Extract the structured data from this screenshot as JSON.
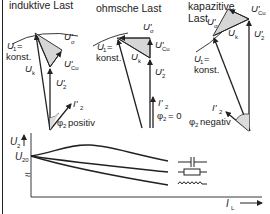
{
  "diagram": {
    "panels": [
      {
        "id": "inductive",
        "title": "induktive Last",
        "labels": {
          "u1": "U",
          "u1_sub": "1",
          "u1_eq": "=",
          "konst": "konst.",
          "usigma": "U'",
          "usigma_sub": "σ",
          "ucu": "U'",
          "ucu_sub": "Cu",
          "uk": "U",
          "uk_sub": "k",
          "u2": "U'",
          "u2_sub": "2",
          "i2": "I'",
          "i2_sub": "2",
          "phi": "φ",
          "phi_sub": "2",
          "phi_text": "positiv"
        }
      },
      {
        "id": "ohmic",
        "title": "ohmsche Last",
        "labels": {
          "u1": "U",
          "u1_sub": "1",
          "u1_eq": "=",
          "konst": "konst.",
          "usigma": "U'",
          "usigma_sub": "σ",
          "ucu": "U'",
          "ucu_sub": "Cu",
          "uk": "U",
          "uk_sub": "k",
          "u2": "U'",
          "u2_sub": "2",
          "i2": "I'",
          "i2_sub": "2",
          "phi": "φ",
          "phi_sub": "2",
          "phi_text": "= 0"
        }
      },
      {
        "id": "capacitive",
        "title_line1": "kapazitive",
        "title_line2": "Last",
        "labels": {
          "u1": "U",
          "u1_sub": "1",
          "u1_eq": "=",
          "konst": "konst.",
          "usigma": "U'",
          "usigma_sub": "σ",
          "ucu": "U'",
          "ucu_sub": "Cu",
          "uk": "U",
          "uk_sub": "k",
          "u2": "U'",
          "u2_sub": "2",
          "i2": "I'",
          "i2_sub": "2",
          "phi": "φ",
          "phi_sub": "2",
          "phi_text": "negativ"
        }
      }
    ],
    "characteristic": {
      "y_label": "U",
      "y_label_sub": "2",
      "y0_label": "U",
      "y0_label_sub": "20",
      "axis_break": "≈",
      "x_label": "I",
      "x_label_sub": "L",
      "curves": [
        {
          "name": "capacitive",
          "symbol": "capacitor-icon",
          "trend": "rises then falls"
        },
        {
          "name": "resistive",
          "symbol": "resistor-icon",
          "trend": "slight decrease"
        },
        {
          "name": "inductive",
          "symbol": "inductor-icon",
          "trend": "strong decrease"
        }
      ]
    },
    "colors": {
      "line": "#222222",
      "fill_triangle": "#d9d9d9",
      "background": "#ffffff"
    }
  }
}
